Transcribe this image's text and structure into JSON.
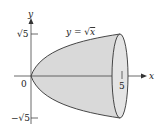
{
  "figure": {
    "type": "solid-of-revolution",
    "curve_label": "y = √x",
    "curve_label_parts": {
      "lhs": "y",
      "eq": " = ",
      "rad": "√",
      "arg": "x"
    },
    "x_axis_label": "x",
    "y_axis_label": "y",
    "origin_label": "0",
    "x_tick_label": "5",
    "y_tick_top_label": "√5",
    "y_tick_bottom_label": "−√5",
    "colors": {
      "fill": "#d9d9d9",
      "stroke": "#333333",
      "axis": "#444444"
    }
  }
}
